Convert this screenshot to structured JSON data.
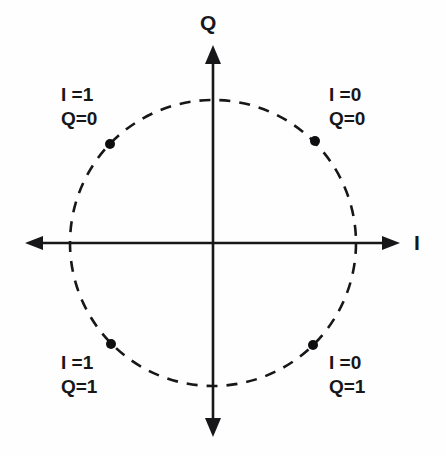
{
  "figure": {
    "background_color": "#fefefe",
    "line_color": "#17171a"
  },
  "axes": {
    "horizontal": {
      "label": "I",
      "name": "in-phase-axis",
      "from_x": 25,
      "to_x": 400,
      "y": 243,
      "arrow_start": true,
      "arrow_end": true
    },
    "vertical": {
      "label": "Q",
      "name": "quadrature-axis",
      "x": 213,
      "from_y": 45,
      "to_y": 437,
      "arrow_start": true,
      "arrow_end": true
    }
  },
  "circle": {
    "name": "unit-circle",
    "center_x": 213,
    "center_y": 243,
    "radius": 143,
    "style": "dashed",
    "dash": "11 9",
    "stroke_width": 2.6
  },
  "points": [
    {
      "name": "constellation-point-i1-q0",
      "x": 110,
      "y": 144,
      "angle_deg": 135,
      "i": "1",
      "q": "0"
    },
    {
      "name": "constellation-point-i0-q0",
      "x": 315,
      "y": 141,
      "angle_deg": 45,
      "i": "0",
      "q": "0"
    },
    {
      "name": "constellation-point-i1-q1",
      "x": 111,
      "y": 344,
      "angle_deg": 225,
      "i": "1",
      "q": "1"
    },
    {
      "name": "constellation-point-i0-q1",
      "x": 313,
      "y": 345,
      "angle_deg": 315,
      "i": "0",
      "q": "1"
    }
  ],
  "quadrant_labels": [
    {
      "name": "quadrant-label-top-left",
      "i_line": "I =1",
      "q_line": "Q=0"
    },
    {
      "name": "quadrant-label-top-right",
      "i_line": "I =0",
      "q_line": "Q=0"
    },
    {
      "name": "quadrant-label-bottom-left",
      "i_line": "I =1",
      "q_line": "Q=1"
    },
    {
      "name": "quadrant-label-bottom-right",
      "i_line": "I =0",
      "q_line": "Q=1"
    }
  ],
  "chart_data": {
    "type": "scatter",
    "xlabel": "I",
    "ylabel": "Q",
    "xlim": [
      -1.35,
      1.35
    ],
    "ylim": [
      -1.4,
      1.4
    ],
    "grid": false,
    "legend": "none",
    "annotations": [
      "I =1 / Q=0 (upper left)",
      "I =0 / Q=0 (upper right)",
      "I =1 / Q=1 (lower left)",
      "I =0 / Q=1 (lower right)"
    ],
    "series": [
      {
        "name": "QPSK symbols",
        "marker": "filled-circle",
        "points": [
          {
            "x": -0.72,
            "y": 0.69,
            "label": "I=1 Q=0"
          },
          {
            "x": 0.71,
            "y": 0.71,
            "label": "I=0 Q=0"
          },
          {
            "x": -0.71,
            "y": -0.71,
            "label": "I=1 Q=1"
          },
          {
            "x": 0.7,
            "y": -0.71,
            "label": "I=0 Q=1"
          }
        ]
      },
      {
        "name": "unit circle",
        "marker": "none",
        "style": "dashed",
        "radius": 1.0
      }
    ]
  }
}
